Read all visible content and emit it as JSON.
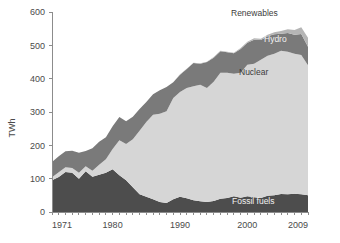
{
  "chart_data": {
    "type": "area",
    "stacked": true,
    "title": "",
    "subtitle": "",
    "xlabel": "",
    "ylabel": "TWh",
    "xlim": [
      1971,
      2009
    ],
    "ylim": [
      0,
      600
    ],
    "ytick_labels": [
      "0",
      "100",
      "200",
      "300",
      "400",
      "500",
      "600"
    ],
    "yticks": [
      0,
      100,
      200,
      300,
      400,
      500,
      600
    ],
    "xtick_labels": [
      "1971",
      "1980",
      "1990",
      "2000",
      "2009"
    ],
    "xticks": [
      1971,
      1980,
      1990,
      2000,
      2009
    ],
    "grid": false,
    "legend_position": "inline-annotations",
    "x": [
      1971,
      1972,
      1973,
      1974,
      1975,
      1976,
      1977,
      1978,
      1979,
      1980,
      1981,
      1982,
      1983,
      1984,
      1985,
      1986,
      1987,
      1988,
      1989,
      1990,
      1991,
      1992,
      1993,
      1994,
      1995,
      1996,
      1997,
      1998,
      1999,
      2000,
      2001,
      2002,
      2003,
      2004,
      2005,
      2006,
      2007,
      2008,
      2009
    ],
    "series": [
      {
        "name": "Fossil fuels",
        "color": "#4d4d4d",
        "label_color": "#f2f2f2",
        "values": [
          95,
          105,
          120,
          118,
          100,
          122,
          106,
          112,
          118,
          128,
          110,
          95,
          74,
          53,
          46,
          38,
          30,
          27,
          38,
          46,
          41,
          35,
          32,
          30,
          33,
          40,
          42,
          47,
          43,
          47,
          44,
          42,
          49,
          50,
          54,
          53,
          55,
          53,
          50
        ]
      },
      {
        "name": "Nuclear",
        "color": "#d6d6d6",
        "label_color": "#3c3c3c",
        "values": [
          9,
          14,
          14,
          14,
          18,
          15,
          18,
          30,
          40,
          61,
          105,
          109,
          144,
          191,
          224,
          254,
          265,
          275,
          304,
          314,
          331,
          342,
          350,
          342,
          358,
          378,
          376,
          368,
          375,
          395,
          401,
          415,
          420,
          425,
          430,
          428,
          420,
          418,
          390
        ]
      },
      {
        "name": "Hydro",
        "color": "#7a7a7a",
        "label_color": "#f2f2f2",
        "values": [
          46,
          48,
          48,
          52,
          60,
          46,
          67,
          69,
          66,
          68,
          70,
          68,
          68,
          65,
          60,
          61,
          70,
          73,
          47,
          52,
          57,
          70,
          63,
          78,
          72,
          64,
          61,
          61,
          71,
          66,
          72,
          59,
          58,
          58,
          51,
          56,
          57,
          63,
          56
        ]
      },
      {
        "name": "Renewables",
        "color": "#b5b5b5",
        "label_color": "#3c3c3c",
        "values": [
          0,
          0,
          0,
          0,
          0,
          0,
          0,
          0,
          0,
          0,
          0,
          0,
          0,
          0,
          0,
          0,
          0,
          0,
          0,
          1,
          1,
          1,
          1,
          1,
          2,
          2,
          2,
          2,
          3,
          3,
          4,
          4,
          5,
          6,
          8,
          11,
          14,
          20,
          27
        ]
      }
    ],
    "annotations": [
      {
        "text": "Renewables",
        "x_px": 231,
        "y_px": 16,
        "style": "dark"
      },
      {
        "text": "Hydro",
        "x_px": 264,
        "y_px": 42,
        "style": "light"
      },
      {
        "text": "Nuclear",
        "x_px": 239,
        "y_px": 75,
        "style": "dark"
      },
      {
        "text": "Fossil fuels",
        "x_px": 232,
        "y_px": 204,
        "style": "light"
      }
    ]
  }
}
